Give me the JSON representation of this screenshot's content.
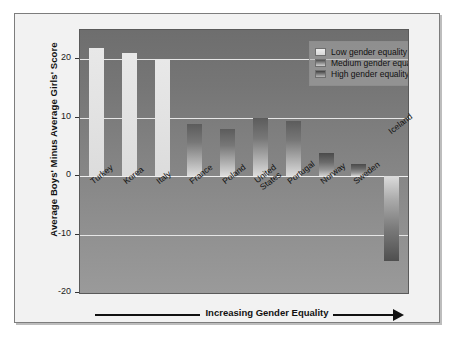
{
  "chart_data": {
    "type": "bar",
    "title": "",
    "xlabel": "Increasing Gender Equality",
    "ylabel": "Average Boys' Minus Average Girls' Score",
    "ylim": [
      -20,
      25
    ],
    "yticks": [
      20,
      10,
      0,
      -10,
      -20
    ],
    "ytick_labels": [
      "20",
      "10",
      "0",
      "-10",
      "-20"
    ],
    "grid": true,
    "legend_position": "top-right",
    "categories": [
      "Turkey",
      "Korea",
      "Italy",
      "France",
      "Poland",
      "United States",
      "Portugal",
      "Norway",
      "Sweden",
      "Iceland"
    ],
    "values": [
      22,
      21,
      20,
      9,
      8,
      10,
      9.5,
      4,
      2,
      -14.5
    ],
    "groups": [
      "low",
      "low",
      "low",
      "medium",
      "medium",
      "medium",
      "medium",
      "high",
      "high",
      "high"
    ],
    "legend": [
      {
        "key": "low",
        "label": "Low gender equality"
      },
      {
        "key": "medium",
        "label": "Medium gender equality"
      },
      {
        "key": "high",
        "label": "High gender equality"
      }
    ]
  },
  "colors": {
    "plot_background_top": "#6e6e6e",
    "plot_background_bottom": "#9a9a9a",
    "gridline": "#e6e6e6",
    "card_background": "#f2f2f2",
    "card_border": "#7d7d7d",
    "text": "#111111"
  }
}
